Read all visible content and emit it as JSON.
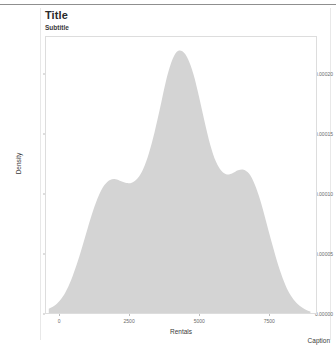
{
  "header": {
    "title": "Title",
    "subtitle": "Subtitle"
  },
  "footer": {
    "caption": "Caption"
  },
  "chart_data": {
    "type": "area",
    "title": "Title",
    "subtitle": "Subtitle",
    "caption": "Caption",
    "xlabel": "Rentals",
    "ylabel": "Density",
    "xlim": [
      -500,
      9200
    ],
    "ylim": [
      0,
      0.000232
    ],
    "grid": false,
    "legend": null,
    "fill_color": "#d4d4d4",
    "xticks": [
      0,
      2500,
      5000,
      7500
    ],
    "xtick_labels": [
      "0",
      "2500",
      "5000",
      "7500"
    ],
    "yticks": [
      0.0,
      5e-05,
      0.0001,
      0.00015,
      0.0002
    ],
    "ytick_labels": [
      "0.00000",
      "0.00005",
      "0.00010",
      "0.00015",
      "0.00020"
    ],
    "series": [
      {
        "name": "Density",
        "x": [
          -400,
          -200,
          0,
          200,
          400,
          600,
          800,
          1000,
          1200,
          1400,
          1600,
          1800,
          2000,
          2200,
          2400,
          2600,
          2800,
          3000,
          3200,
          3400,
          3600,
          3800,
          4000,
          4200,
          4400,
          4600,
          4800,
          5000,
          5200,
          5400,
          5600,
          5800,
          6000,
          6200,
          6400,
          6600,
          6800,
          7000,
          7200,
          7400,
          7600,
          7800,
          8000,
          8200,
          8400,
          8600,
          8800,
          9000
        ],
        "y": [
          3.5e-06,
          6e-06,
          1.05e-05,
          1.75e-05,
          2.75e-05,
          4.05e-05,
          5.55e-05,
          7.15e-05,
          8.65e-05,
          9.9e-05,
          0.0001075,
          0.0001118,
          0.0001125,
          0.0001108,
          0.0001092,
          0.0001098,
          0.0001135,
          0.0001215,
          0.0001345,
          0.000152,
          0.0001725,
          0.000194,
          0.0002105,
          0.0002195,
          0.00022,
          0.0002135,
          0.0002005,
          0.0001815,
          0.0001605,
          0.0001415,
          0.0001275,
          0.0001195,
          0.0001165,
          0.0001175,
          0.00012,
          0.0001205,
          0.000117,
          0.000108,
          9.45e-05,
          7.75e-05,
          6e-05,
          4.35e-05,
          2.95e-05,
          1.85e-05,
          1.12e-05,
          6.2e-06,
          3.2e-06,
          1.2e-06
        ]
      }
    ],
    "peaks": [
      {
        "label": "main-peak",
        "x": 4400,
        "y": 0.00022
      },
      {
        "label": "left-shoulder",
        "x": 2000,
        "y": 0.0001125
      },
      {
        "label": "right-shoulder",
        "x": 6600,
        "y": 0.0001205
      }
    ]
  }
}
